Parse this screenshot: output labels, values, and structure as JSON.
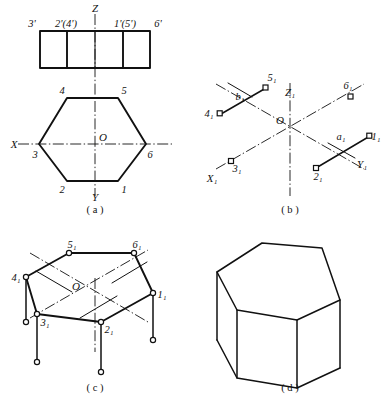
{
  "figure": {
    "title_context": "Hexagonal prism orthographic and isometric projection construction",
    "panels": [
      {
        "id": "a",
        "caption": "( a )"
      },
      {
        "id": "b",
        "caption": "( b )"
      },
      {
        "id": "c",
        "caption": "( c )"
      },
      {
        "id": "d",
        "caption": "( d )"
      }
    ]
  },
  "panel_a": {
    "axis_labels": {
      "z": "Z",
      "x": "X",
      "y": "Y",
      "origin": "O"
    },
    "front_view_labels": [
      "3'",
      "2'(4')",
      "1'(5')",
      "6'"
    ],
    "top_view_labels": {
      "v4": "4",
      "v5": "5",
      "v3": "3",
      "v6": "6",
      "v2": "2",
      "v1": "1"
    }
  },
  "panel_b": {
    "axis_labels": {
      "z1": "Z₁",
      "x1": "X₁",
      "y1": "Y₁",
      "origin": "O"
    },
    "point_labels": {
      "p1": "1₁",
      "p2": "2₁",
      "p3": "3₁",
      "p4": "4₁",
      "p5": "5₁",
      "p6": "6₁",
      "a1": "a₁",
      "b1": "b₁"
    }
  },
  "panel_c": {
    "origin": "O",
    "point_labels": {
      "p1": "1₁",
      "p2": "2₁",
      "p3": "3₁",
      "p4": "4₁",
      "p5": "5₁",
      "p6": "6₁"
    }
  },
  "panel_d": {
    "description": "completed hexagonal prism isometric drawing"
  },
  "colors": {
    "ink": "#111111",
    "paper": "#ffffff"
  }
}
